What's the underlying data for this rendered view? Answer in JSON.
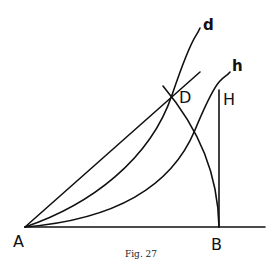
{
  "figure": {
    "caption": "Fig. 27",
    "points": {
      "A": {
        "label": "A",
        "x": 25,
        "y": 227
      },
      "B": {
        "label": "B",
        "x": 219,
        "y": 227
      },
      "D": {
        "label": "D",
        "x": 172,
        "y": 95
      },
      "H": {
        "label": "H",
        "x": 219,
        "y": 90
      }
    },
    "curve_labels": {
      "d": "d",
      "h": "h"
    },
    "elements": [
      "baseline from A through B",
      "perpendicular BH",
      "straight line from A through D",
      "curve d from A through D",
      "curve h from A through H",
      "arc from B through D"
    ]
  }
}
